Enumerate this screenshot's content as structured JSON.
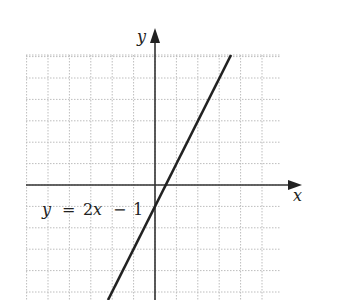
{
  "chart_data": {
    "type": "line",
    "title": "",
    "xlabel": "x",
    "ylabel": "y",
    "equation_label": "y = 2x − 1",
    "slope": 2,
    "intercept": -1,
    "series": [
      {
        "name": "y = 2x - 1",
        "x": [
          -2.2,
          3.54
        ],
        "y": [
          -5.4,
          6.08
        ]
      }
    ],
    "xlim": [
      -6,
      6
    ],
    "ylim": [
      -5.4,
      6
    ],
    "grid": true,
    "grid_spacing": 1,
    "legend": "none"
  },
  "labels": {
    "x_axis": "x",
    "y_axis": "y",
    "eq_y": "y",
    "eq_eq": "=",
    "eq_2x_coef": "2",
    "eq_2x_var": "x",
    "eq_minus": "−",
    "eq_one": "1"
  },
  "colors": {
    "grid": "#b8b8b8",
    "axis": "#333333",
    "line": "#222222"
  }
}
